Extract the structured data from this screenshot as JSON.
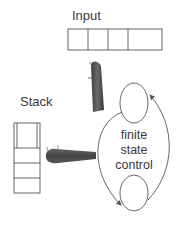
{
  "labels": {
    "input": "Input",
    "stack": "Stack",
    "control_line1": "finite",
    "control_line2": "state",
    "control_line3": "control"
  },
  "input_tape": {
    "cells": 4
  },
  "stack": {
    "cells": 4
  },
  "colors": {
    "stroke": "#555555",
    "text": "#3a3a3a",
    "head": "#4a4a4a"
  }
}
